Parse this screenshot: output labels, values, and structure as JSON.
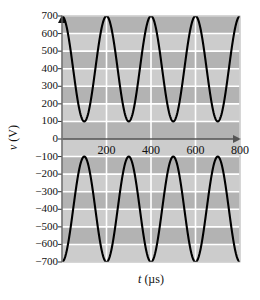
{
  "chart_data": {
    "type": "line",
    "title": "",
    "xlabel": "t (µs)",
    "xlabel_symbol": "t",
    "xlabel_unit": "(µs)",
    "ylabel": "v (V)",
    "ylabel_symbol": "v",
    "ylabel_unit": "(V)",
    "xlim": [
      0,
      800
    ],
    "ylim": [
      -700,
      700
    ],
    "xticks": [
      200,
      400,
      600,
      800
    ],
    "xtick_labels": [
      "200",
      "400",
      "600",
      "800"
    ],
    "yticks": [
      700,
      600,
      500,
      400,
      300,
      200,
      100,
      0,
      -100,
      -200,
      -300,
      -400,
      -500,
      -600,
      -700
    ],
    "ytick_labels": [
      "700",
      "600",
      "500",
      "400",
      "300",
      "200",
      "100",
      "0",
      "−100",
      "−200",
      "−300",
      "−400",
      "−500",
      "−600",
      "−700"
    ],
    "grid": true,
    "grid_color": "#ffffff",
    "plot_bg_color": "#bfbfbf",
    "band_color_dark": "#b3b3b3",
    "band_color_light": "#cccccc",
    "curve_color": "#000000",
    "axis_color": "#555555",
    "legend": null,
    "series": [
      {
        "name": "upper-waveform",
        "form": "cosine",
        "offset": 400,
        "amplitude": 300,
        "period": 200,
        "phase_deg": 0,
        "max": 700,
        "min": 100,
        "x": [
          0,
          25,
          50,
          75,
          100,
          125,
          150,
          175,
          200,
          225,
          250,
          275,
          300,
          325,
          350,
          375,
          400,
          425,
          450,
          475,
          500,
          525,
          550,
          575,
          600,
          625,
          650,
          675,
          700,
          725,
          750,
          775,
          800
        ],
        "values": [
          700,
          612,
          400,
          188,
          100,
          188,
          400,
          612,
          700,
          612,
          400,
          188,
          100,
          188,
          400,
          612,
          700,
          612,
          400,
          188,
          100,
          188,
          400,
          612,
          700,
          612,
          400,
          188,
          100,
          188,
          400,
          612,
          700
        ]
      },
      {
        "name": "lower-waveform",
        "form": "cosine",
        "offset": -400,
        "amplitude": -300,
        "period": 200,
        "phase_deg": 0,
        "max": -100,
        "min": -700,
        "x": [
          0,
          25,
          50,
          75,
          100,
          125,
          150,
          175,
          200,
          225,
          250,
          275,
          300,
          325,
          350,
          375,
          400,
          425,
          450,
          475,
          500,
          525,
          550,
          575,
          600,
          625,
          650,
          675,
          700,
          725,
          750,
          775,
          800
        ],
        "values": [
          -700,
          -612,
          -400,
          -188,
          -100,
          -188,
          -400,
          -612,
          -700,
          -612,
          -400,
          -188,
          -100,
          -188,
          -400,
          -612,
          -700,
          -612,
          -400,
          -188,
          -100,
          -188,
          -400,
          -612,
          -700,
          -612,
          -400,
          -188,
          -100,
          -188,
          -400,
          -612,
          -700
        ]
      }
    ]
  }
}
